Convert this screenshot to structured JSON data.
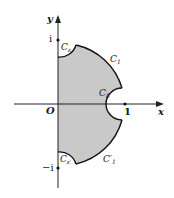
{
  "diagram": {
    "type": "complex-plane contour",
    "colors": {
      "region_fill": "#c9c9c9",
      "axis": "#222222",
      "contour": "#111111",
      "background": "#ffffff"
    },
    "axes": {
      "x_label": "x",
      "y_label": "y",
      "origin_label": "O",
      "tick_labels": {
        "one": "1",
        "i": "i",
        "minus_i": "−i"
      }
    },
    "curves": {
      "c_eps_top": {
        "main": "C",
        "sub": "ε"
      },
      "c_one_top": {
        "main": "C",
        "sub": "1"
      },
      "c_delta": {
        "main": "C",
        "sub": "δ"
      },
      "c_eps_bottom": {
        "main": "C",
        "sub": "ε′"
      },
      "c_one_bottom": {
        "main": "C′",
        "sub": "1"
      }
    }
  }
}
